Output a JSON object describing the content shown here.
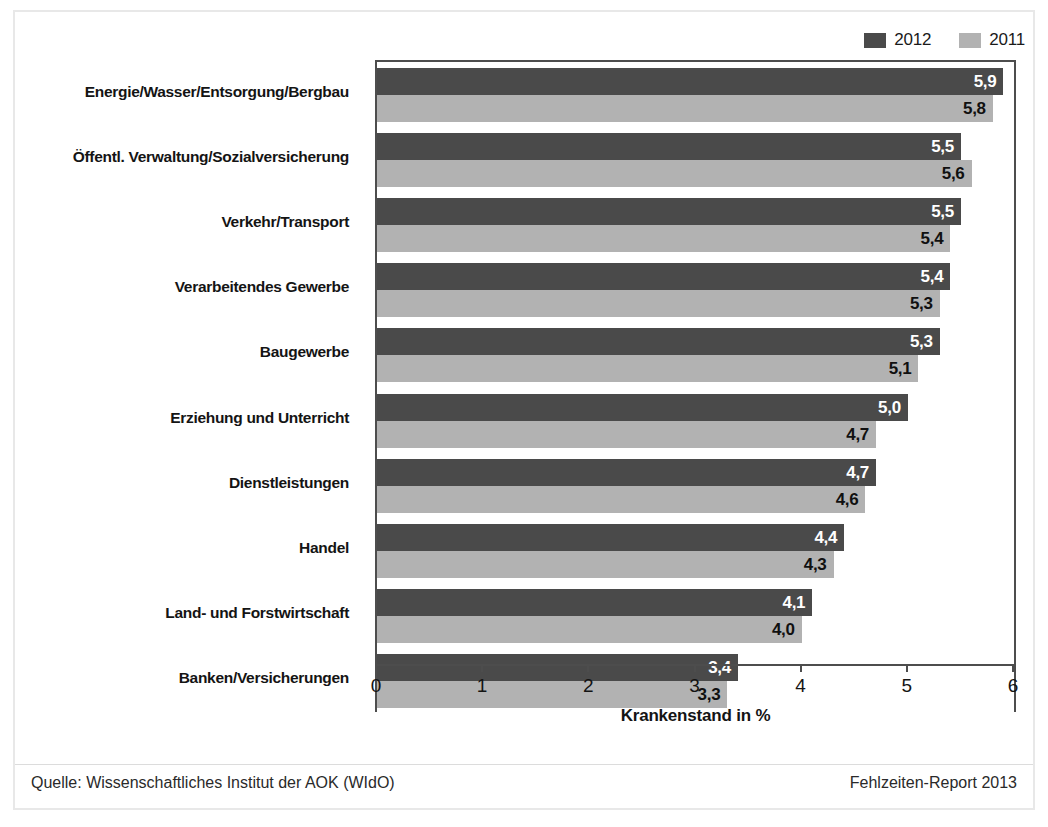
{
  "chart_data": {
    "type": "bar",
    "orientation": "horizontal",
    "title": "",
    "xlabel": "Krankenstand in %",
    "ylabel": "",
    "xlim": [
      0,
      6
    ],
    "xticks": [
      "0",
      "1",
      "2",
      "3",
      "4",
      "5",
      "6"
    ],
    "grid": false,
    "legend_position": "top-right",
    "categories": [
      "Energie/Wasser/Entsorgung/Bergbau",
      "Öffentl. Verwaltung/Sozialversicherung",
      "Verkehr/Transport",
      "Verarbeitendes Gewerbe",
      "Baugewerbe",
      "Erziehung und Unterricht",
      "Dienstleistungen",
      "Handel",
      "Land- und Forstwirtschaft",
      "Banken/Versicherungen"
    ],
    "series": [
      {
        "name": "2012",
        "color": "#4a4a4a",
        "values": [
          5.9,
          5.5,
          5.5,
          5.4,
          5.3,
          5.0,
          4.7,
          4.4,
          4.1,
          3.4
        ],
        "labels": [
          "5,9",
          "5,5",
          "5,5",
          "5,4",
          "5,3",
          "5,0",
          "4,7",
          "4,4",
          "4,1",
          "3,4"
        ]
      },
      {
        "name": "2011",
        "color": "#b2b2b2",
        "values": [
          5.8,
          5.6,
          5.4,
          5.3,
          5.1,
          4.7,
          4.6,
          4.3,
          4.0,
          3.3
        ],
        "labels": [
          "5,8",
          "5,6",
          "5,4",
          "5,3",
          "5,1",
          "4,7",
          "4,6",
          "4,3",
          "4,0",
          "3,3"
        ]
      }
    ]
  },
  "legend": {
    "items": [
      {
        "label": "2012",
        "color": "#4a4a4a"
      },
      {
        "label": "2011",
        "color": "#b2b2b2"
      }
    ]
  },
  "axis": {
    "title": "Krankenstand in %",
    "ticks": [
      "0",
      "1",
      "2",
      "3",
      "4",
      "5",
      "6"
    ]
  },
  "footer": {
    "source": "Quelle: Wissenschaftliches Institut der AOK (WIdO)",
    "report": "Fehlzeiten-Report 2013"
  }
}
